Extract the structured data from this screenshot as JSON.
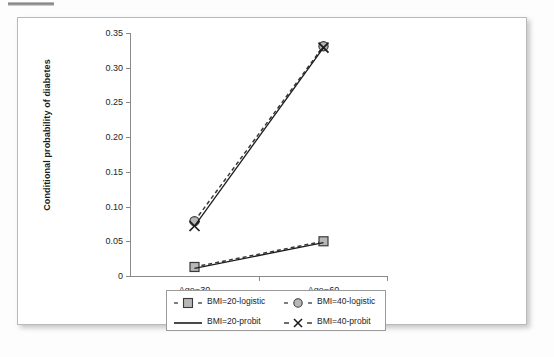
{
  "figure": {
    "y_axis_title": "Conditional probability of diabetes"
  },
  "chart_data": {
    "type": "line",
    "title": "",
    "xlabel": "",
    "ylabel": "Conditional probability of diabetes",
    "categories": [
      "Age=30",
      "Age=60"
    ],
    "ylim": [
      0,
      0.35
    ],
    "ytick_labels": [
      "0",
      "0.05",
      "0.10",
      "0.15",
      "0.20",
      "0.25",
      "0.30",
      "0.35"
    ],
    "ytick_values": [
      0,
      0.05,
      0.1,
      0.15,
      0.2,
      0.25,
      0.3,
      0.35
    ],
    "grid": false,
    "legend_position": "bottom",
    "series": [
      {
        "name": "BMI=20-logistic",
        "values": [
          0.013,
          0.05
        ],
        "marker": "square",
        "line_style": "dashed",
        "color": "#3a3a3a",
        "marker_fill": "#b7b7b7"
      },
      {
        "name": "BMI=40-logistic",
        "values": [
          0.079,
          0.331
        ],
        "marker": "circle",
        "line_style": "dashed",
        "color": "#3a3a3a",
        "marker_fill": "#b7b7b7"
      },
      {
        "name": "BMI=20-probit",
        "values": [
          0.011,
          0.048
        ],
        "marker": "none",
        "line_style": "solid",
        "color": "#1c1c1c",
        "marker_fill": "none"
      },
      {
        "name": "BMI=40-probit",
        "values": [
          0.072,
          0.329
        ],
        "marker": "cross",
        "line_style": "solid",
        "color": "#1c1c1c",
        "marker_fill": "none"
      }
    ]
  },
  "legend": {
    "entries": [
      {
        "label": "BMI=20-logistic",
        "key": "dashed-square-key"
      },
      {
        "label": "BMI=40-logistic",
        "key": "dashed-circle-key"
      },
      {
        "label": "BMI=20-probit",
        "key": "solid-line-key"
      },
      {
        "label": "BMI=40-probit",
        "key": "dashed-cross-key"
      }
    ]
  }
}
